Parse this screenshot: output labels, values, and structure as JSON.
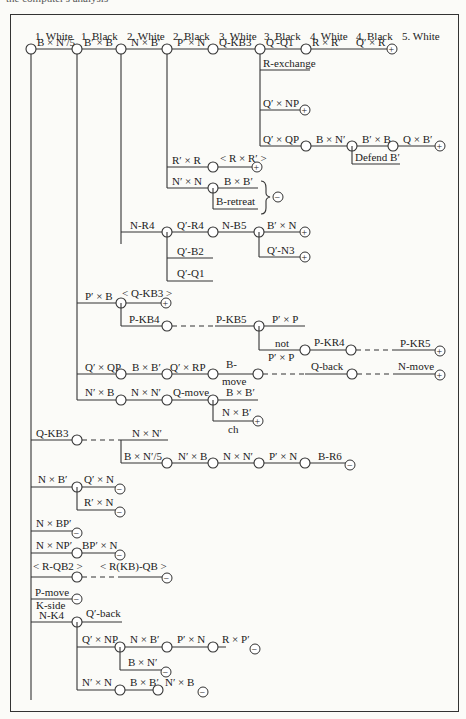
{
  "caption": "the computer's analysis",
  "header": {
    "columns": [
      "1. White",
      "1. Black",
      "2. White",
      "2. Black",
      "3. White",
      "3. Black",
      "4. White",
      "4. Black",
      "5. White"
    ]
  },
  "moves": {
    "m1": "B × N′/5",
    "m2": "B′ × B",
    "m3": "N × B′",
    "m4": "P′ × N",
    "m5": "Q-KB3",
    "m6": "Q′-Q1",
    "m7": "R × R′",
    "m8": "Q′ × R",
    "r_exchange": "R-exchange",
    "q_np": "Q′ × NP",
    "q_qp": "Q′ × QP",
    "b_n": "B × N′",
    "bp_b": "B′ × B",
    "q_b": "Q × B′",
    "defend_b": "Defend B′",
    "rp_r": "R′ × R",
    "r_rp": "< R × R′ >",
    "np_n": "N′ × N",
    "b_bp": "B × B′",
    "b_retreat": "B-retreat",
    "n_r4": "N-R4",
    "qp_r4": "Q′-R4",
    "n_b5": "N-B5",
    "bp_n": "B′ × N",
    "qp_n3": "Q′-N3",
    "qp_b2": "Q′-B2",
    "qp_q1": "Q′-Q1",
    "pp_b": "P′ × B",
    "q_kb3b": "< Q-KB3 >",
    "p_kb4": "P-KB4",
    "p_kb5": "P-KB5",
    "pp_p": "P′ × P",
    "not": "not",
    "pp_p2": "P′ × P",
    "p_kr4": "P-KR4",
    "p_kr5": "P-KR5",
    "qp_qp": "Q′ × QP",
    "b_bp2": "B × B′",
    "qp_rp": "Q′ × RP",
    "b_move1": "B-",
    "b_move2": "move",
    "q_back": "Q-back",
    "n_move": "N-move",
    "np_b": "N′ × B",
    "n_np": "N × N′",
    "q_move": "Q-move",
    "b_bp3": "B × B′",
    "n_bp": "N × B′",
    "ch": "ch",
    "q_kb3": "Q-KB3",
    "n_np2": "N × N′",
    "b_n5": "B × N′/5",
    "np_b2": "N′ × B",
    "n_np3": "N × N′",
    "pp_n": "P′ × N",
    "b_r6": "B-R6",
    "n_bp2": "N × B′",
    "qp_n": "Q′ × N",
    "rp_n": "R′ × N",
    "n_bpp": "N × BP′",
    "n_npp": "N × NP′",
    "bpp_n": "BP′ × N",
    "r_qb2": "< R-QB2 >",
    "r_kbqb": "< R(KB)-QB >",
    "p_move": "P-move",
    "k_side": "K-side",
    "n_k4": "N-K4",
    "qp_back": "Q′-back",
    "qp_np2": "Q′ × NP",
    "n_bp3": "N × B′",
    "pp_n2": "P′ × N",
    "r_pp": "R × P′",
    "b_np2": "B × N′",
    "np_n2": "N′ × N",
    "b_bp4": "B × B′",
    "np_b3": "N′ × B"
  },
  "outcomes": {
    "win": "+",
    "loss": "−"
  }
}
